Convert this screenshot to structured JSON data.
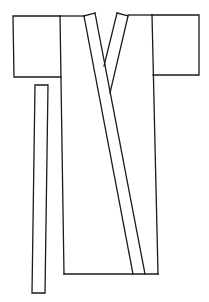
{
  "figure": {
    "stroke_color": "#1a1a1a",
    "background": "#ffffff",
    "parts": [
      {
        "name": "left-sleeve",
        "shape": "rectangle"
      },
      {
        "name": "right-sleeve",
        "shape": "rectangle"
      },
      {
        "name": "body",
        "shape": "rectangle"
      },
      {
        "name": "collar-band",
        "shape": "diagonal band"
      },
      {
        "name": "right-collar",
        "shape": "diagonal band"
      },
      {
        "name": "sash-belt",
        "shape": "long narrow strip"
      }
    ]
  }
}
